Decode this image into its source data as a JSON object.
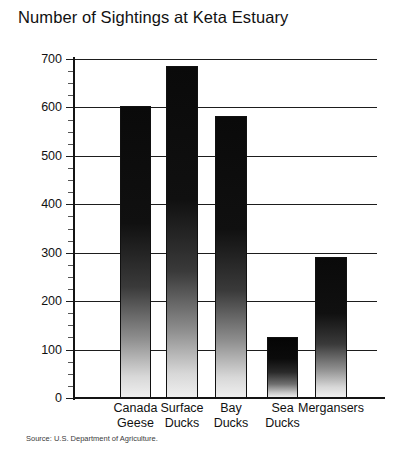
{
  "chart_data": {
    "type": "bar",
    "title": "Number of Sightings at Keta Estuary",
    "xlabel": "",
    "ylabel": "",
    "ylim": [
      0,
      700
    ],
    "ytick_step": 100,
    "minor_tick_step": 25,
    "grid": true,
    "legend": null,
    "categories": [
      "Canada Geese",
      "Surface Ducks",
      "Bay Ducks",
      "Sea Ducks",
      "Mergansers"
    ],
    "category_lines": [
      [
        "Canada",
        "Geese"
      ],
      [
        "Surface",
        "Ducks"
      ],
      [
        "Bay",
        "Ducks"
      ],
      [
        "Sea",
        "Ducks"
      ],
      [
        "Mergansers"
      ]
    ],
    "values": [
      602,
      685,
      583,
      125,
      292
    ],
    "ytick_labels": [
      "700",
      "600",
      "500",
      "400",
      "300",
      "200",
      "100",
      "0"
    ],
    "ytick_values": [
      700,
      600,
      500,
      400,
      300,
      200,
      100,
      0
    ],
    "annotation": "Source: U.S. Department of Agriculture.",
    "colors": {
      "axis": "#141414",
      "grid": "#1d1d1d",
      "bar_top": "#0a0a0a",
      "bar_bottom": "#efefef",
      "text": "#111111",
      "background": "#ffffff"
    }
  }
}
